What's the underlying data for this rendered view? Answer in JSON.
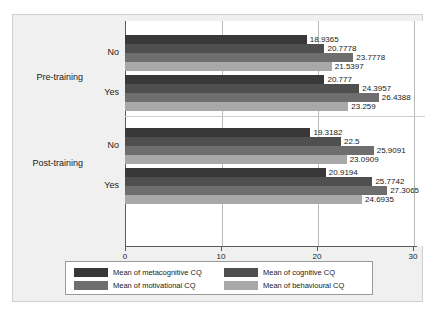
{
  "chart_data": {
    "type": "bar",
    "orientation": "horizontal",
    "title": "",
    "xlabel": "",
    "ylabel": "",
    "xlim": [
      0,
      30
    ],
    "xticks": [
      0,
      10,
      20,
      30
    ],
    "xtick_labels": [
      "0",
      "10",
      "20",
      "30"
    ],
    "grid": true,
    "legend_position": "bottom",
    "group_labels": [
      "Pre-training",
      "Post-training"
    ],
    "categories": [
      "No",
      "Yes",
      "No",
      "Yes"
    ],
    "groups": [
      {
        "group": "Pre-training",
        "subgroups": [
          {
            "label": "No",
            "values": [
              18.9365,
              20.7778,
              23.7778,
              21.5397
            ],
            "value_labels": [
              "18.9365",
              "20.7778",
              "23.7778",
              "21.5397"
            ]
          },
          {
            "label": "Yes",
            "values": [
              20.777,
              24.3957,
              26.4388,
              23.259
            ],
            "value_labels": [
              "20.777",
              "24.3957",
              "26.4388",
              "23.259"
            ]
          }
        ]
      },
      {
        "group": "Post-training",
        "subgroups": [
          {
            "label": "No",
            "values": [
              19.3182,
              22.5,
              25.9091,
              23.0909
            ],
            "value_labels": [
              "19.3182",
              "22.5",
              "25.9091",
              "23.0909"
            ]
          },
          {
            "label": "Yes",
            "values": [
              20.9194,
              25.7742,
              27.3065,
              24.6935
            ],
            "value_labels": [
              "20.9194",
              "25.7742",
              "27.3065",
              "24.6935"
            ]
          }
        ]
      }
    ],
    "series": [
      {
        "name": "Mean of metacognitive CQ",
        "color": "#383838",
        "values": [
          18.9365,
          20.777,
          19.3182,
          20.9194
        ]
      },
      {
        "name": "Mean of cognitive CQ",
        "color": "#4f4f4f",
        "values": [
          20.7778,
          24.3957,
          22.5,
          25.7742
        ]
      },
      {
        "name": "Mean of motivational CQ",
        "color": "#6e6e6e",
        "values": [
          23.7778,
          26.4388,
          25.9091,
          27.3065
        ]
      },
      {
        "name": "Mean of behavioural CQ",
        "color": "#a8a8a8",
        "values": [
          21.5397,
          23.259,
          23.0909,
          24.6935
        ]
      }
    ]
  },
  "legend": {
    "items": [
      {
        "label": "Mean of metacognitive CQ",
        "color": "#383838"
      },
      {
        "label": "Mean of cognitive CQ",
        "color": "#4f4f4f"
      },
      {
        "label": "Mean of motivational CQ",
        "color": "#6e6e6e"
      },
      {
        "label": "Mean of behavioural CQ",
        "color": "#a8a8a8"
      }
    ]
  },
  "axis": {
    "tick_labels": [
      "0",
      "10",
      "20",
      "30"
    ]
  },
  "labels": {
    "group_0": "Pre-training",
    "group_1": "Post-training",
    "sub_0": "No",
    "sub_1": "Yes",
    "sub_2": "No",
    "sub_3": "Yes"
  },
  "colors": {
    "panel_bg": "#f0f0f0",
    "plot_bg": "#ffffff",
    "axis": "#5a5a5a",
    "grid": "#b9b9b9",
    "text": "#1a1a1a"
  }
}
